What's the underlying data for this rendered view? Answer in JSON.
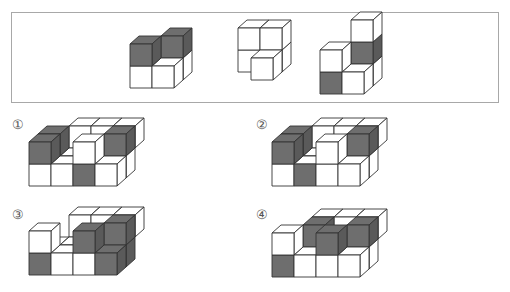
{
  "question_box": {
    "pieces": [
      {
        "id": "piece-1",
        "cubes": 5,
        "shaded_faces": 2
      },
      {
        "id": "piece-2",
        "cubes": 4,
        "shaded_faces": 0
      },
      {
        "id": "piece-3",
        "cubes": 5,
        "shaded_faces": 2
      }
    ]
  },
  "options": [
    {
      "label": "①"
    },
    {
      "label": "②"
    },
    {
      "label": "③"
    },
    {
      "label": "④"
    }
  ],
  "colors": {
    "shade": "#6e6e6e",
    "shade_side": "#5a5a5a",
    "face": "#ffffff",
    "stroke": "#333333",
    "border": "#a8a8a8"
  }
}
